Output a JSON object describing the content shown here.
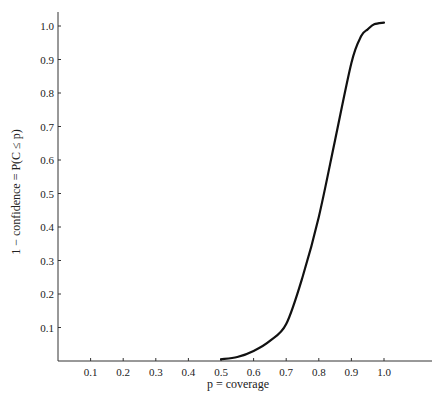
{
  "chart_data": {
    "type": "line",
    "title": "",
    "xlabel": "p = coverage",
    "ylabel": "1 − confidence = P(C ≤ p)",
    "xlim": [
      0,
      1.15
    ],
    "ylim": [
      0,
      1.05
    ],
    "grid": false,
    "legend": null,
    "x_ticks": [
      "0.1",
      "0.2",
      "0.3",
      "0.4",
      "0.5",
      "0.6",
      "0.7",
      "0.8",
      "0.9",
      "1.0"
    ],
    "y_ticks": [
      "0.1",
      "0.2",
      "0.3",
      "0.4",
      "0.5",
      "0.6",
      "0.7",
      "0.8",
      "0.9",
      "1.0"
    ],
    "series": [
      {
        "name": "P(C ≤ p)",
        "x": [
          0.5,
          0.55,
          0.6,
          0.65,
          0.7,
          0.75,
          0.8,
          0.85,
          0.9,
          0.93,
          0.95,
          0.97,
          1.0
        ],
        "values": [
          0.005,
          0.012,
          0.03,
          0.06,
          0.11,
          0.25,
          0.43,
          0.66,
          0.89,
          0.97,
          0.99,
          1.005,
          1.01
        ]
      }
    ]
  }
}
